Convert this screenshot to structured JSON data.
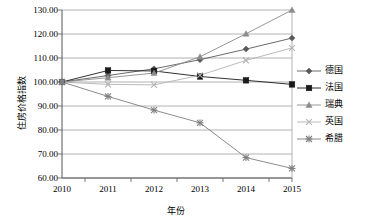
{
  "chart_data": {
    "type": "line",
    "title": "",
    "xlabel": "年份",
    "ylabel": "住房价格指数",
    "x": [
      2010,
      2011,
      2012,
      2013,
      2014,
      2015
    ],
    "categories": [
      "2010",
      "2011",
      "2012",
      "2013",
      "2014",
      "2015"
    ],
    "xticklabels": [
      "2010",
      "2011",
      "2012",
      "2013",
      "2014",
      "2015"
    ],
    "yticklabels": [
      "60.00",
      "70.00",
      "80.00",
      "90.00",
      "100.00",
      "110.00",
      "120.00",
      "130.00"
    ],
    "ylim": [
      60,
      130
    ],
    "ytick_step": 10,
    "grid": "horizontal",
    "legend_position": "right",
    "series": [
      {
        "name": "德国",
        "marker": "diamond",
        "color": "#595959",
        "values": [
          100.0,
          102.7,
          105.5,
          109.3,
          113.7,
          118.3
        ]
      },
      {
        "name": "法国",
        "marker": "square",
        "color": "#1a1a1a",
        "values": [
          100.0,
          104.8,
          104.6,
          102.3,
          100.7,
          99.0
        ]
      },
      {
        "name": "瑞典",
        "marker": "triangle",
        "color": "#8c8c8c",
        "values": [
          100.0,
          101.8,
          103.7,
          110.5,
          120.1,
          130.0
        ]
      },
      {
        "name": "英国",
        "marker": "cross",
        "color": "#b3b3b3",
        "values": [
          100.0,
          99.0,
          98.8,
          102.8,
          109.0,
          114.2
        ]
      },
      {
        "name": "希腊",
        "marker": "asterisk",
        "color": "#7f7f7f",
        "values": [
          100.0,
          94.0,
          88.3,
          83.0,
          68.5,
          64.0
        ]
      }
    ]
  },
  "legend": {
    "items": [
      {
        "label": "德国"
      },
      {
        "label": "法国"
      },
      {
        "label": "瑞典"
      },
      {
        "label": "英国"
      },
      {
        "label": "希腊"
      }
    ]
  }
}
